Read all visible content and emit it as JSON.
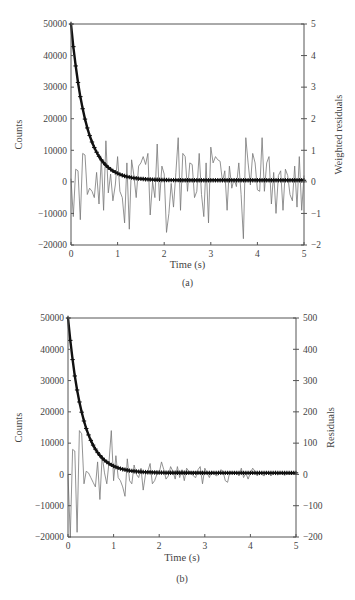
{
  "chart_data": [
    {
      "panel": "(a)",
      "type": "line",
      "title": "",
      "caption": "(a)",
      "xlabel": "Time (s)",
      "ylabel_left": "Counts",
      "ylabel_right": "Weighted residuals",
      "xlim": [
        0,
        5
      ],
      "ylim_left": [
        -20000,
        50000
      ],
      "ylim_right": [
        -2,
        5
      ],
      "xticks": [
        0,
        1,
        2,
        3,
        4,
        5
      ],
      "yticks_left": [
        -20000,
        -10000,
        0,
        10000,
        20000,
        30000,
        40000,
        50000
      ],
      "yticks_right": [
        -2,
        -1,
        0,
        1,
        2,
        3,
        4,
        5
      ],
      "grid": false,
      "series": [
        {
          "name": "Decay fit (counts)",
          "axis": "left",
          "style": "thick line with cross markers",
          "model": "exponential decay",
          "A": 50000,
          "tau": 0.32,
          "baseline": 500,
          "x_start": 0,
          "x_end": 5,
          "n_points": 100
        },
        {
          "name": "Weighted residuals",
          "axis": "right",
          "style": "thin gray line",
          "x_start": 0,
          "x_end": 5,
          "values": [
            0.1,
            -1.1,
            0.4,
            0.35,
            -1.2,
            0.9,
            0.85,
            -0.4,
            -0.2,
            -0.3,
            -0.5,
            0.3,
            -0.7,
            0.75,
            -0.9,
            1.3,
            -0.35,
            0.25,
            -0.6,
            -0.1,
            0.8,
            -0.3,
            -0.5,
            -1.3,
            0.6,
            -1.5,
            0.7,
            0.2,
            -0.5,
            0.5,
            0.6,
            0.8,
            0.55,
            0.9,
            -1.05,
            0.0,
            -0.5,
            1.2,
            -0.6,
            0.5,
            0.25,
            -1.6,
            -1.0,
            -0.05,
            -0.8,
            0.3,
            1.4,
            -0.9,
            0.9,
            0.8,
            -0.3,
            0.6,
            0.55,
            -0.5,
            -0.3,
            0.9,
            -0.4,
            -1.1,
            0.6,
            -1.3,
            1.1,
            0.6,
            0.8,
            0.7,
            0.65,
            0.0,
            0.35,
            -0.9,
            0.5,
            -0.2,
            0.1,
            -0.15,
            0.6,
            -0.4,
            -1.8,
            1.4,
            0.6,
            -0.1,
            0.9,
            0.6,
            -0.25,
            -0.3,
            1.4,
            -0.3,
            0.6,
            0.8,
            -0.7,
            0.3,
            -1.0,
            0.2,
            0.35,
            -0.9,
            0.4,
            0.2,
            -0.4,
            -0.6,
            0.5,
            -0.8,
            0.8,
            -0.9,
            0.2
          ]
        }
      ]
    },
    {
      "panel": "(b)",
      "type": "line",
      "title": "",
      "caption": "(b)",
      "xlabel": "Time (s)",
      "ylabel_left": "Counts",
      "ylabel_right": "Residuals",
      "xlim": [
        0,
        5
      ],
      "ylim_left": [
        -20000,
        50000
      ],
      "ylim_right": [
        -200,
        500
      ],
      "xticks": [
        0,
        1,
        2,
        3,
        4,
        5
      ],
      "yticks_left": [
        -20000,
        -10000,
        0,
        10000,
        20000,
        30000,
        40000,
        50000
      ],
      "yticks_right": [
        -200,
        -100,
        0,
        100,
        200,
        300,
        400,
        500
      ],
      "grid": false,
      "series": [
        {
          "name": "Decay fit (counts)",
          "axis": "left",
          "style": "thick line with cross markers",
          "model": "exponential decay",
          "A": 50000,
          "tau": 0.32,
          "baseline": 500,
          "x_start": 0,
          "x_end": 5,
          "n_points": 100
        },
        {
          "name": "Residuals",
          "axis": "right",
          "style": "thin gray line",
          "x_start": 0,
          "x_end": 5,
          "values": [
            0,
            -200,
            80,
            75,
            -185,
            140,
            130,
            -30,
            10,
            5,
            -10,
            -25,
            -40,
            40,
            -80,
            60,
            5,
            -30,
            40,
            140,
            -20,
            60,
            -10,
            -20,
            -40,
            -70,
            50,
            -20,
            -30,
            30,
            0,
            -10,
            20,
            -50,
            0,
            10,
            35,
            -30,
            -20,
            0,
            5,
            40,
            15,
            -15,
            -5,
            25,
            10,
            -15,
            25,
            -10,
            15,
            -20,
            20,
            10,
            5,
            -5,
            -10,
            15,
            25,
            -30,
            20,
            5,
            -10,
            10,
            5,
            -5,
            0,
            15,
            10,
            -20,
            -25,
            10,
            5,
            8,
            6,
            -5,
            20,
            -10,
            5,
            -15,
            5,
            20,
            10,
            -5,
            5,
            0,
            -5,
            8,
            5,
            -5,
            3,
            5,
            -2,
            3,
            2,
            -3,
            2,
            0,
            1,
            0,
            0
          ]
        }
      ]
    }
  ]
}
